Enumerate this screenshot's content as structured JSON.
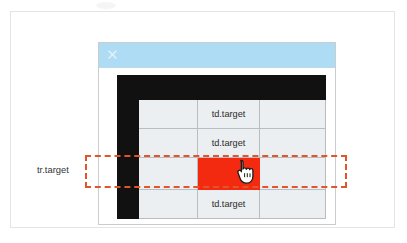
{
  "canvas": {
    "width": 407,
    "height": 243,
    "background": "#ffffff"
  },
  "outer_frame": {
    "border_color": "#e2e4e6"
  },
  "dialog": {
    "titlebar": {
      "color": "#aedcf4",
      "close_icon": "✕",
      "close_icon_name": "close-icon",
      "title": ""
    },
    "border_color": "#c9cdd0"
  },
  "annotation": {
    "row_label": "tr.target",
    "dash_color": "#e2552a"
  },
  "cursor": {
    "type": "pointing-hand",
    "x": 224,
    "y": 147
  },
  "colors": {
    "header_black": "#111111",
    "cell_plain": "#eceff1",
    "cell_target": "#fbece0",
    "cell_target_highlight": "#fdeede",
    "cell_red": "#f32a10",
    "grid_line": "#b9bdc0",
    "titlebar_blue": "#aedcf4"
  },
  "table": {
    "columns": [
      "",
      "",
      "",
      ""
    ],
    "rows": [
      {
        "name": "header-row",
        "highlighted": false,
        "cells": [
          {
            "text": "",
            "style": "black"
          },
          {
            "text": "",
            "style": "black"
          },
          {
            "text": "",
            "style": "black"
          },
          {
            "text": "",
            "style": "black"
          }
        ]
      },
      {
        "name": "row-2",
        "highlighted": false,
        "cells": [
          {
            "text": "",
            "style": "black"
          },
          {
            "text": "",
            "style": "plain"
          },
          {
            "text": "td.target",
            "style": "target"
          },
          {
            "text": "",
            "style": "plain"
          }
        ]
      },
      {
        "name": "row-3",
        "highlighted": false,
        "cells": [
          {
            "text": "",
            "style": "black"
          },
          {
            "text": "",
            "style": "plain"
          },
          {
            "text": "td.target",
            "style": "target"
          },
          {
            "text": "",
            "style": "plain"
          }
        ]
      },
      {
        "name": "row-4",
        "highlighted": true,
        "cells": [
          {
            "text": "",
            "style": "black"
          },
          {
            "text": "",
            "style": "plain"
          },
          {
            "text": "",
            "style": "red"
          },
          {
            "text": "",
            "style": "plain"
          }
        ]
      },
      {
        "name": "row-5",
        "highlighted": false,
        "cells": [
          {
            "text": "",
            "style": "black"
          },
          {
            "text": "",
            "style": "plain"
          },
          {
            "text": "td.target",
            "style": "target"
          },
          {
            "text": "",
            "style": "plain"
          }
        ]
      }
    ]
  }
}
